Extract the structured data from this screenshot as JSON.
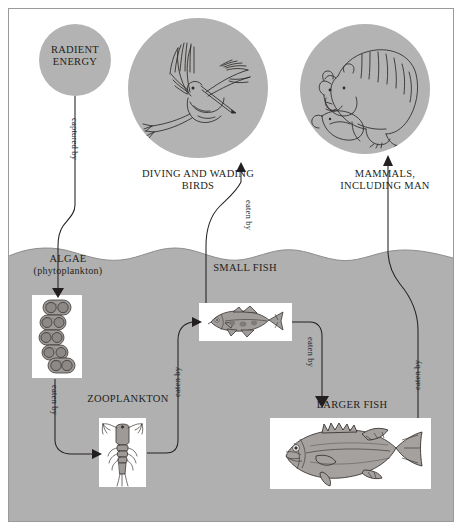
{
  "diagram": {
    "type": "food-chain-flow",
    "colors": {
      "water": "#b0b0b0",
      "medallion": "#b3b3b3",
      "frame_border": "#9a9a9a",
      "ink": "#231f20",
      "plate": "#ffffff",
      "page_background": "#ffffff"
    },
    "nodes": [
      {
        "id": "radiant-energy",
        "label": "RADIENT\nENERGY",
        "line1": "RADIENT",
        "line2": "ENERGY",
        "shape": "circle",
        "zone": "sky"
      },
      {
        "id": "diving-wading-birds",
        "label": "DIVING AND WADING\nBIRDS",
        "line1": "DIVING AND WADING",
        "line2": "BIRDS",
        "shape": "circle-medallion",
        "illustration": "heron-in-flight",
        "zone": "sky"
      },
      {
        "id": "mammals-including-man",
        "label": "MAMMALS,\nINCLUDING MAN",
        "line1": "MAMMALS,",
        "line2": "INCLUDING MAN",
        "shape": "circle-medallion",
        "illustration": "bear-with-fish",
        "zone": "sky"
      },
      {
        "id": "algae",
        "label": "ALGAE\n(phytoplankton)",
        "line1": "ALGAE",
        "line2": "(phytoplankton)",
        "shape": "plate",
        "illustration": "algae-cell-chain",
        "zone": "water"
      },
      {
        "id": "zooplankton",
        "label": "ZOOPLANKTON",
        "line1": "ZOOPLANKTON",
        "line2": "",
        "shape": "plate",
        "illustration": "copepod",
        "zone": "water"
      },
      {
        "id": "small-fish",
        "label": "SMALL FISH",
        "line1": "SMALL FISH",
        "line2": "",
        "shape": "plate",
        "illustration": "small-fish",
        "zone": "water"
      },
      {
        "id": "larger-fish",
        "label": "LARGER FISH",
        "line1": "LARGER FISH",
        "line2": "",
        "shape": "plate",
        "illustration": "largemouth-bass",
        "zone": "water"
      }
    ],
    "edges": [
      {
        "id": "edge-sun-to-algae",
        "from": "radiant-energy",
        "to": "algae",
        "label": "captured by"
      },
      {
        "id": "edge-algae-to-zoo",
        "from": "algae",
        "to": "zooplankton",
        "label": "eaten by"
      },
      {
        "id": "edge-zoo-to-smallfish",
        "from": "zooplankton",
        "to": "small-fish",
        "label": "eaten by"
      },
      {
        "id": "edge-smallfish-to-birds",
        "from": "small-fish",
        "to": "diving-wading-birds",
        "label": "eaten by"
      },
      {
        "id": "edge-smallfish-to-larger",
        "from": "small-fish",
        "to": "larger-fish",
        "label": "eaten by"
      },
      {
        "id": "edge-larger-to-mammals",
        "from": "larger-fish",
        "to": "mammals-including-man",
        "label": "eaten by"
      }
    ]
  }
}
